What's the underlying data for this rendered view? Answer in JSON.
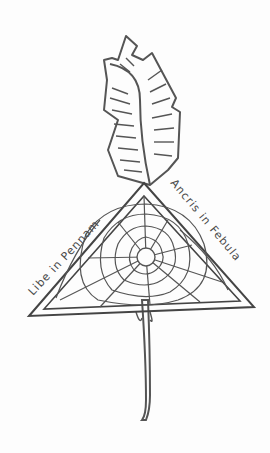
{
  "drawing": {
    "subject": "feather quill with spider web triangle",
    "left_inscription": "Libe in Pennam",
    "right_inscription": "Ancris in Febula",
    "colors": {
      "ink": "#4a4a4a",
      "background": "#fdfdfd"
    }
  }
}
